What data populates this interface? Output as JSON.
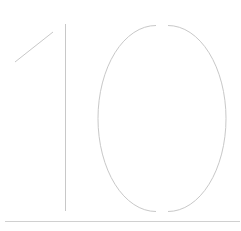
{
  "glyph": {
    "text": "10",
    "stroke_color": "#c8c8c8",
    "baseline_color": "#d0d0d0"
  }
}
